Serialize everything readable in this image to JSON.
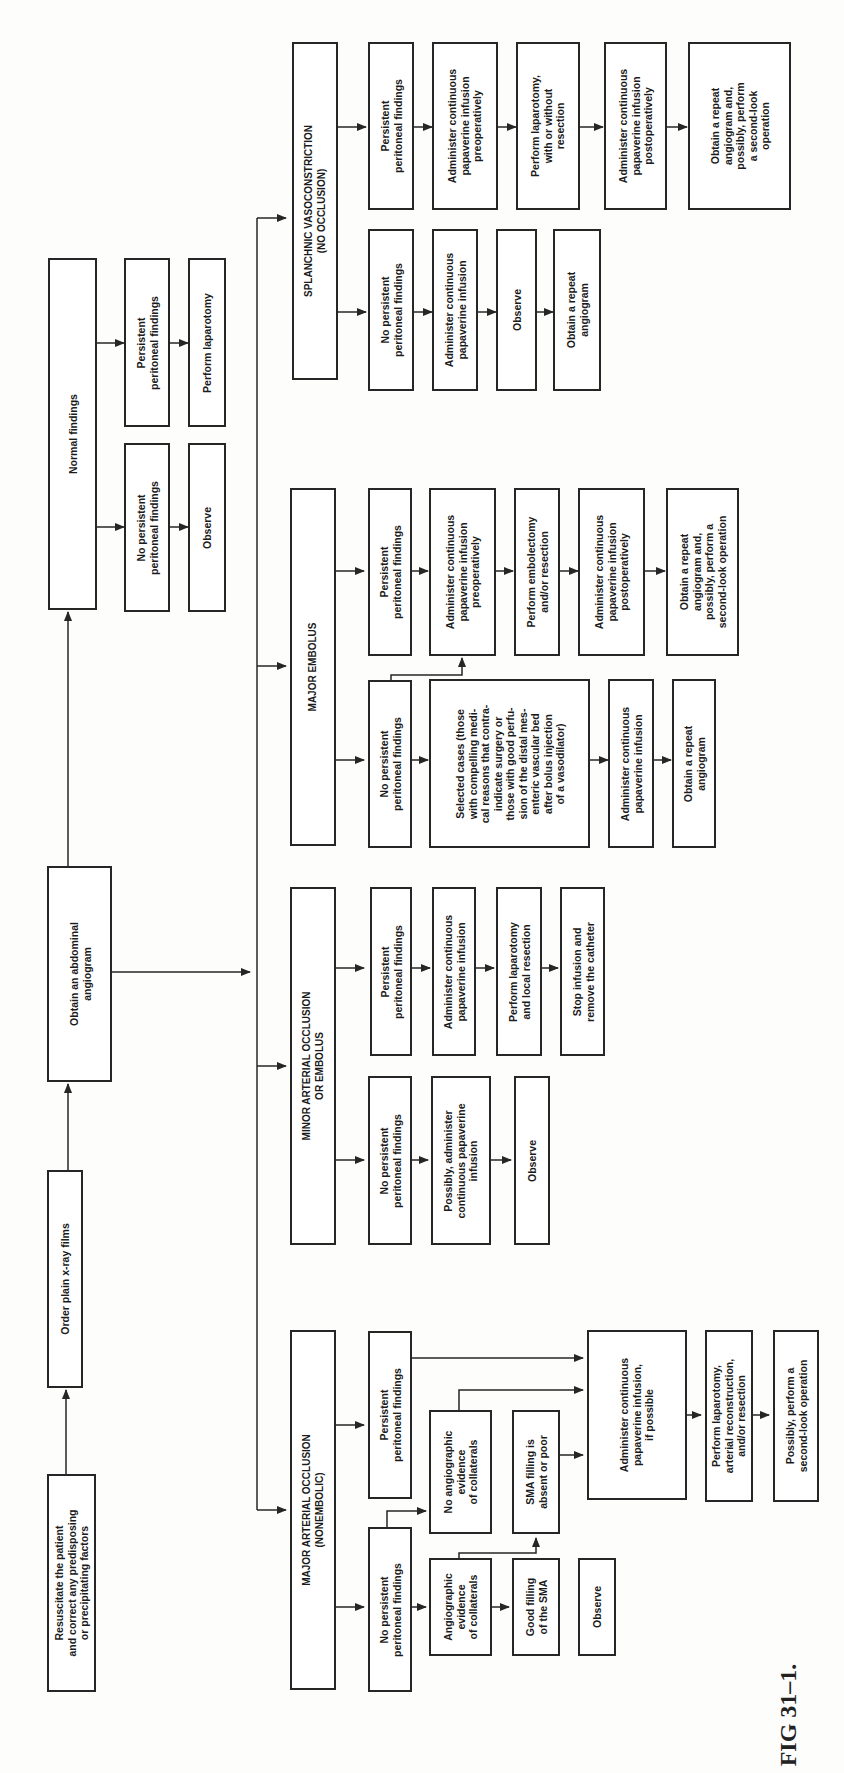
{
  "figure": {
    "caption": "FIG 31–1.",
    "colors": {
      "ink": "#262626",
      "background": "#fdfdfc"
    }
  },
  "main_flow": {
    "resuscitate": "Resuscitate the patient\nand correct any predisposing\nor precipitating factors",
    "xray": "Order plain x-ray films",
    "angiogram": "Obtain an abdominal\nangiogram"
  },
  "normal_findings": {
    "title": "Normal findings",
    "no_persistent": "No persistent\nperitoneal findings",
    "observe": "Observe",
    "persistent": "Persistent\nperitoneal findings",
    "laparotomy": "Perform laparotomy"
  },
  "major_occlusion": {
    "title": "MAJOR ARTERIAL OCCLUSION\n(NONEMBOLIC)",
    "no_persistent": "No persistent\nperitoneal findings",
    "angio_evidence": "Angiographic\nevidence\nof collaterals",
    "good_filling": "Good filling\nof the SMA",
    "observe": "Observe",
    "no_angio_evidence": "No angiographic\nevidence\nof collaterals",
    "sma_absent": "SMA filling is\nabsent or poor",
    "persistent": "Persistent\nperitoneal findings",
    "papaverine": "Administer continuous\npapaverine infusion,\nif possible",
    "laparotomy": "Perform laparotomy,\narterial reconstruction,\nand/or resection",
    "second_look": "Possibly, perform a\nsecond-look operation"
  },
  "minor_occlusion": {
    "title": "MINOR ARTERIAL OCCLUSION\nOR EMBOLUS",
    "no_persistent": "No persistent\nperitoneal findings",
    "possibly_papaverine": "Possibly, administer\ncontinuous papaverine\ninfusion",
    "observe": "Observe",
    "persistent": "Persistent\nperitoneal findings",
    "papaverine": "Administer continuous\npapaverine infusion",
    "laparotomy": "Perform laparotomy\nand local resection",
    "stop_infusion": "Stop infusion and\nremove the catheter"
  },
  "major_embolus": {
    "title": "MAJOR EMBOLUS",
    "no_persistent": "No persistent\nperitoneal findings",
    "selected_cases": "Selected cases (those\nwith compelling medi-\ncal reasons that contra-\nindicate surgery or\nthose with good perfu-\nsion of the distal mes-\nenteric vascular bed\nafter bolus injection\nof a vasodilator)",
    "papaverine": "Administer continuous\npapaverine infusion",
    "repeat_angiogram": "Obtain a repeat\nangiogram",
    "persistent": "Persistent\nperitoneal findings",
    "papaverine_preop": "Administer continuous\npapaverine infusion\npreoperatively",
    "embolectomy": "Perform embolectomy\nand/or resection",
    "papaverine_postop": "Administer continuous\npapaverine infusion\npostoperatively",
    "repeat_and_second_look": "Obtain a repeat\nangiogram and,\npossibly, perform a\nsecond-look operation"
  },
  "splanchnic": {
    "title": "SPLANCHNIC VASOCONSTRICTION\n(NO OCCLUSION)",
    "no_persistent": "No persistent\nperitoneal findings",
    "papaverine": "Administer continuous\npapaverine infusion",
    "observe": "Observe",
    "repeat_angiogram": "Obtain a repeat\nangiogram",
    "persistent": "Persistent\nperitoneal findings",
    "papaverine_preop": "Administer continuous\npapaverine infusion\npreoperatively",
    "laparotomy": "Perform laparotomy,\nwith or without\nresection",
    "papaverine_postop": "Administer continuous\npapaverine infusion\npostoperatively",
    "repeat_and_second_look": "Obtain a repeat\nangiogram and,\npossibly, perform\na second-look\noperation"
  }
}
